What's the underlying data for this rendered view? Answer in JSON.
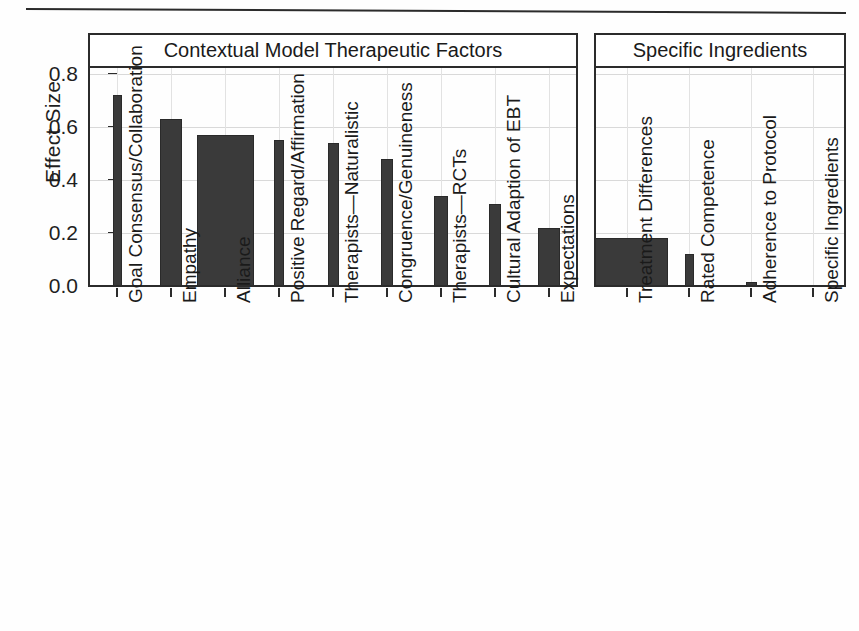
{
  "figure": {
    "y_axis_title": "Effect Size",
    "y_ticks": [
      "0.8",
      "0.6",
      "0.4",
      "0.2",
      "0.0"
    ],
    "panels": [
      {
        "title": "Contextual Model Therapeutic Factors"
      },
      {
        "title": "Specific Ingredients"
      }
    ]
  },
  "chart_data": {
    "type": "bar",
    "title": "",
    "xlabel": "",
    "ylabel": "Effect Size",
    "ylim": [
      -0.04,
      0.84
    ],
    "grid": true,
    "legend": null,
    "panels": [
      {
        "name": "Contextual Model Therapeutic Factors",
        "categories": [
          "Goal Consensus/Collaboration",
          "Empathy",
          "Alliance",
          "Positive Regard/Affirmation",
          "Therapists—Naturalistic",
          "Congruence/Genuineness",
          "Therapists—RCTs",
          "Cultural Adaption of EBT",
          "Expectations"
        ],
        "values": [
          0.72,
          0.63,
          0.57,
          0.55,
          0.54,
          0.48,
          0.34,
          0.31,
          0.22
        ],
        "bar_widths": [
          9,
          22,
          57,
          10,
          11,
          12,
          14,
          12,
          22
        ]
      },
      {
        "name": "Specific Ingredients",
        "categories": [
          "Treatment Differences",
          "Rated Competence",
          "Adherence to Protocol",
          "Specific Ingredients"
        ],
        "values": [
          0.18,
          0.12,
          0.015,
          -0.01
        ],
        "bar_widths": [
          82,
          9,
          11,
          13
        ]
      }
    ]
  },
  "colors": {
    "bar_fill": "#3a3a3a",
    "frame": "#2b2b2b",
    "grid": "#d9d9d9",
    "background": "#ffffff"
  }
}
